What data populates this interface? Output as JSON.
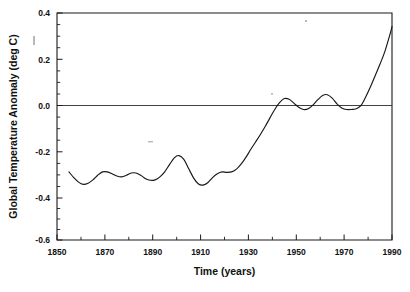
{
  "chart_data": {
    "type": "line",
    "title": "",
    "xlabel": "Time (years)",
    "ylabel": "Global Temperature Anomaly (deg C)",
    "xlim": [
      1850,
      1990
    ],
    "ylim": [
      -0.6,
      0.4
    ],
    "xticks": [
      1850,
      1870,
      1890,
      1910,
      1930,
      1950,
      1970,
      1990
    ],
    "xtick_labels": [
      "1850",
      "1870",
      "1890",
      "1910",
      "1930",
      "1950",
      "1970",
      "1990"
    ],
    "yticks": [
      -0.6,
      -0.4,
      -0.2,
      0.0,
      0.2,
      0.4
    ],
    "ytick_labels": [
      "-0.6",
      "-0.4",
      "-0.2",
      "0.0",
      "0.2",
      "0.4"
    ],
    "xtick_minor_step": 10,
    "ytick_minor_step": 0.05,
    "grid": false,
    "legend": null,
    "zero_reference_line": 0.0,
    "series": [
      {
        "name": "Global temperature anomaly",
        "color": "#17171c",
        "x": [
          1855,
          1857,
          1859,
          1861,
          1863,
          1865,
          1867,
          1869,
          1871,
          1873,
          1875,
          1877,
          1879,
          1881,
          1883,
          1885,
          1887,
          1889,
          1891,
          1893,
          1895,
          1897,
          1899,
          1901,
          1903,
          1905,
          1907,
          1909,
          1911,
          1913,
          1915,
          1917,
          1919,
          1921,
          1923,
          1925,
          1927,
          1929,
          1931,
          1933,
          1935,
          1937,
          1939,
          1941,
          1943,
          1945,
          1947,
          1949,
          1951,
          1953,
          1955,
          1957,
          1959,
          1961,
          1963,
          1965,
          1967,
          1969,
          1971,
          1973,
          1975,
          1977,
          1979,
          1981,
          1983,
          1985,
          1987,
          1989,
          1990
        ],
        "y": [
          -0.3,
          -0.325,
          -0.345,
          -0.355,
          -0.35,
          -0.335,
          -0.315,
          -0.3,
          -0.3,
          -0.308,
          -0.318,
          -0.322,
          -0.315,
          -0.305,
          -0.305,
          -0.315,
          -0.33,
          -0.337,
          -0.335,
          -0.322,
          -0.3,
          -0.268,
          -0.238,
          -0.228,
          -0.245,
          -0.285,
          -0.325,
          -0.352,
          -0.358,
          -0.348,
          -0.325,
          -0.308,
          -0.3,
          -0.302,
          -0.3,
          -0.288,
          -0.265,
          -0.235,
          -0.2,
          -0.168,
          -0.135,
          -0.1,
          -0.062,
          -0.025,
          0.005,
          0.023,
          0.02,
          0.003,
          -0.015,
          -0.025,
          -0.022,
          -0.005,
          0.018,
          0.037,
          0.04,
          0.025,
          0.0,
          -0.018,
          -0.025,
          -0.025,
          -0.022,
          -0.008,
          0.03,
          0.075,
          0.125,
          0.175,
          0.23,
          0.3,
          0.34
        ]
      }
    ]
  },
  "axes": {
    "x_axis_title": "Time (years)",
    "y_axis_title": "Global Temperature Anomaly (deg C)"
  },
  "x_tick_labels": [
    "1850",
    "1870",
    "1890",
    "1910",
    "1930",
    "1950",
    "1970",
    "1990"
  ],
  "y_tick_labels": [
    "0.4",
    "0.2",
    "0.0",
    "-0.2",
    "-0.4",
    "-0.6"
  ]
}
